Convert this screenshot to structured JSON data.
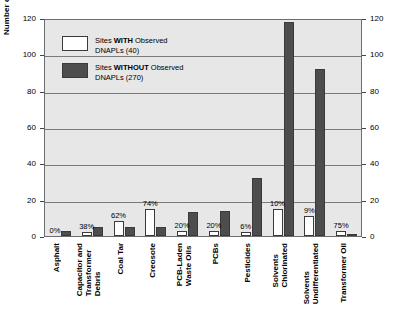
{
  "chart_data": {
    "type": "bar",
    "title": "",
    "xlabel": "",
    "ylabel": "Number of Superfund Sites",
    "ylim": [
      0,
      120
    ],
    "yticks": [
      0,
      20,
      40,
      60,
      80,
      100,
      120
    ],
    "right_axis": true,
    "right_yticks": [
      0,
      20,
      40,
      60,
      80,
      100,
      120
    ],
    "grid": true,
    "legend_position": "upper-left-inside",
    "categories": [
      "Asphalt",
      "Capacitor and\nTransformer\nDebris",
      "Coal Tar",
      "Creosote",
      "PCB-Laden\nWaste Oils",
      "PCBs",
      "Pesticides",
      "Solvents\nChlorinated",
      "Solvents\nUndifferentiated",
      "Transformer Oil"
    ],
    "series": [
      {
        "name": "Sites WITH Observed DNAPLs (40)",
        "color": "#ffffff",
        "values": [
          0,
          2,
          8,
          15,
          3,
          3,
          2,
          15,
          11,
          3
        ]
      },
      {
        "name": "Sites WITHOUT Observed DNAPLs (270)",
        "color": "#4d4d4d",
        "values": [
          3,
          5,
          5,
          5,
          13,
          14,
          32,
          118,
          92,
          1
        ]
      }
    ],
    "annotations": [
      "0%",
      "38%",
      "62%",
      "74%",
      "20%",
      "20%",
      "6%",
      "10%",
      "9%",
      "75%"
    ]
  },
  "legend": {
    "items": [
      {
        "prefix": "Sites ",
        "bold": "WITH",
        "suffix": " Observed",
        "line2": "DNAPLs (40)",
        "swatch": "with"
      },
      {
        "prefix": "Sites ",
        "bold": "WITHOUT",
        "suffix": " Observed",
        "line2": "DNAPLs (270)",
        "swatch": "without"
      }
    ]
  }
}
